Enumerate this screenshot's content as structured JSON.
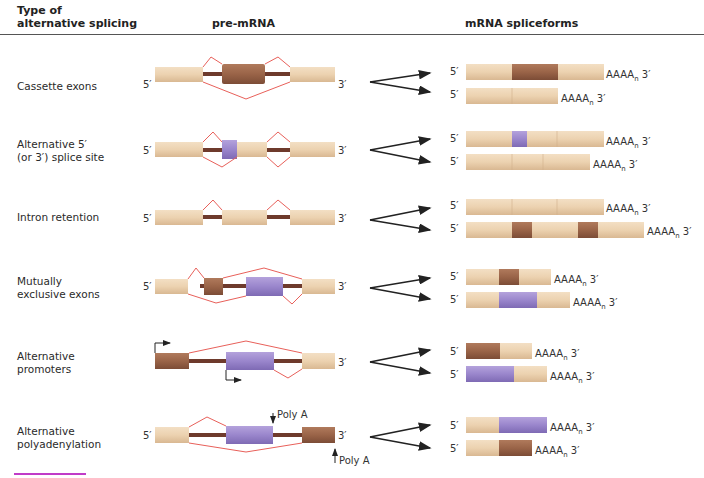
{
  "header": {
    "col1": [
      "Type of",
      "alternative splicing"
    ],
    "col2": "pre-mRNA",
    "col3": "mRNA spliceforms"
  },
  "colors": {
    "constitutive_exon": "#ecd2b0",
    "alt_exon_brown": "#9a6448",
    "alt_exon_purple": "#9a86cc",
    "intron": "#6e3a2c",
    "splice_line": "#e8605a",
    "arrow": "#222222",
    "accent_bar": "#c03cc8"
  },
  "labels": {
    "five_prime": "5′",
    "three_prime": "3′",
    "polyA_tail": "AAAA",
    "polyA_sub": "n",
    "poly_a_site": "Poly A"
  },
  "rows": [
    {
      "type": "Cassette exons",
      "lines": [
        "Cassette exons"
      ]
    },
    {
      "type": "Alternative 5′ (or 3′) splice site",
      "lines": [
        "Alternative 5′",
        "(or 3′) splice site"
      ]
    },
    {
      "type": "Intron retention",
      "lines": [
        "Intron retention"
      ]
    },
    {
      "type": "Mutually exclusive exons",
      "lines": [
        "Mutually",
        "exclusive exons"
      ]
    },
    {
      "type": "Alternative promoters",
      "lines": [
        "Alternative",
        "promoters"
      ]
    },
    {
      "type": "Alternative polyadenylation",
      "lines": [
        "Alternative",
        "polyadenylation"
      ]
    }
  ]
}
